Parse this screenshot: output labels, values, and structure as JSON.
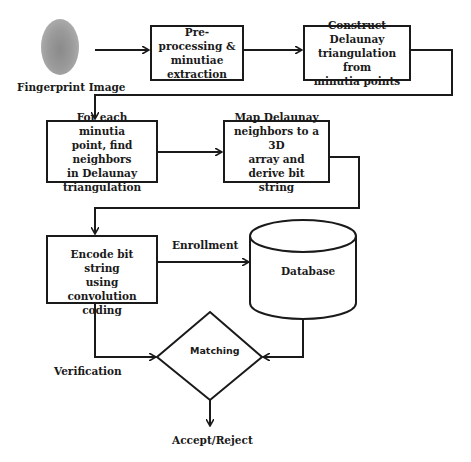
{
  "diagram": {
    "fingerprint": {
      "label": "Fingerprint Image",
      "icon": "fingerprint-image"
    },
    "steps": [
      {
        "id": "preprocess",
        "lines": [
          "Pre-processing &",
          "minutiae",
          "extraction"
        ]
      },
      {
        "id": "delaunay",
        "lines": [
          "Construct Delaunay",
          "triangulation from",
          "minutia points"
        ]
      },
      {
        "id": "neighbors",
        "lines": [
          "For each minutia",
          "point, find neighbors",
          "in Delaunay",
          "triangulation"
        ]
      },
      {
        "id": "map3d",
        "lines": [
          "Map Delaunay",
          "neighbors to a 3D",
          "array and derive bit",
          "string"
        ]
      },
      {
        "id": "encode",
        "lines": [
          "Encode bit string",
          "using convolution",
          "coding"
        ]
      }
    ],
    "database": {
      "label": "Database"
    },
    "decision": {
      "label": "Matching"
    },
    "edge_labels": {
      "enrollment": "Enrollment",
      "verification": "Verification"
    },
    "output": {
      "label": "Accept/Reject"
    },
    "colors": {
      "stroke": "#1a1a1a",
      "background": "#ffffff"
    }
  }
}
